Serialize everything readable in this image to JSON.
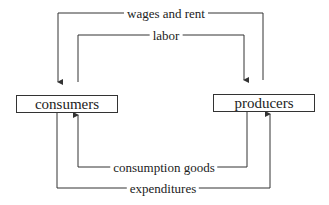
{
  "diagram": {
    "nodes": [
      {
        "id": "consumers",
        "label": "consumers"
      },
      {
        "id": "producers",
        "label": "producers"
      }
    ],
    "flows": [
      {
        "label": "wages and rent",
        "from": "producers",
        "to": "consumers"
      },
      {
        "label": "labor",
        "from": "consumers",
        "to": "producers"
      },
      {
        "label": "consumption goods",
        "from": "producers",
        "to": "consumers"
      },
      {
        "label": "expenditures",
        "from": "consumers",
        "to": "producers"
      }
    ],
    "colors": {
      "line": "#333333",
      "background": "#ffffff"
    }
  }
}
